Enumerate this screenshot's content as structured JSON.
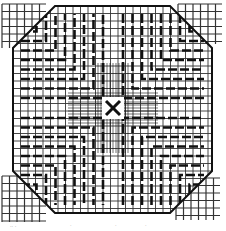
{
  "figure": {
    "colors": {
      "ink": "#111111",
      "grid": "#333333",
      "background": "#ffffff",
      "corner_fill": "#f2f2f2"
    },
    "octagon": {
      "left": 13,
      "top": 6,
      "right": 212,
      "bottom": 213,
      "corner_cut": 42
    },
    "grid_pitch": 7.5,
    "center_marker": {
      "symbol": "×",
      "x": 113,
      "y": 108
    },
    "bottom_marks": [
      ".. .",
      "·",
      "·",
      "·"
    ]
  }
}
